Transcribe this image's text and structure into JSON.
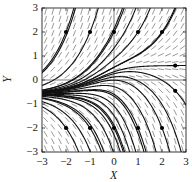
{
  "chart_data": {
    "type": "direction-field",
    "title": "",
    "xlabel": "X",
    "ylabel": "Y",
    "xlim": [
      -3,
      3
    ],
    "ylim": [
      -3,
      3
    ],
    "x_ticks": [
      "−3",
      "−2",
      "−1",
      "0",
      "1",
      "2",
      "3"
    ],
    "y_ticks": [
      "3",
      "2",
      "1",
      "0",
      "−1",
      "−2",
      "−3"
    ],
    "grid": false,
    "reference_lines": {
      "x0": true,
      "y0": true
    },
    "slope_field": {
      "spacing": 0.3,
      "segment_style": "dashed short segments",
      "color": "#555555"
    },
    "ode_model": "dy/dx = y - 0.6*tanh(x)",
    "initial_points": [
      {
        "x": -2,
        "y": 2
      },
      {
        "x": -1,
        "y": 2
      },
      {
        "x": 0,
        "y": 2
      },
      {
        "x": 1,
        "y": 2
      },
      {
        "x": 2,
        "y": 2
      },
      {
        "x": -2,
        "y": -2
      },
      {
        "x": -1,
        "y": -2
      },
      {
        "x": 0,
        "y": -2
      },
      {
        "x": 1,
        "y": -2
      },
      {
        "x": 2,
        "y": -2
      },
      {
        "x": 2.55,
        "y": 0.6
      },
      {
        "x": 2.55,
        "y": -0.45
      }
    ],
    "extra_curves_start_x": -3,
    "extra_curves_start_y": [
      -0.42,
      -0.46,
      -0.5,
      -0.52,
      -0.54,
      -0.56,
      -0.58,
      -0.6,
      -0.62,
      -0.64,
      -0.68,
      -0.75,
      -0.9,
      0.3
    ],
    "curve_color": "#111111",
    "dot_color": "#000000"
  }
}
